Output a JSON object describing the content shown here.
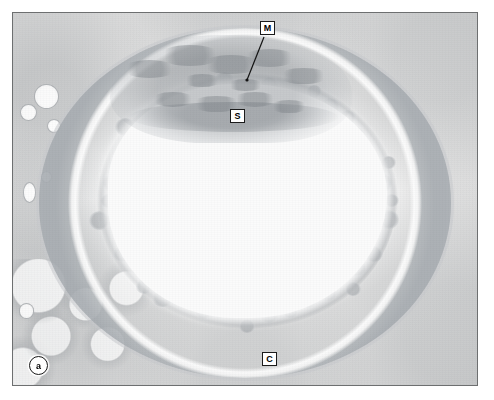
{
  "figure": {
    "kind": "light-micrograph",
    "panel_label": "a",
    "border_color": "#6d6f70",
    "background_color": "#ffffff"
  },
  "plate": {
    "x": 12,
    "y": 12,
    "width": 466,
    "height": 374,
    "stain_tone": "pale grey monochrome (H&E, desaturated)",
    "lumen_color": "#fbfbfb",
    "tissue_color": "#d5d5d5",
    "dark_detail_color": "#7a7f84"
  },
  "annotations": [
    {
      "id": "mucosa",
      "label": "M",
      "box_x": 259,
      "box_y": 20,
      "leader": {
        "from_x": 263,
        "from_y": 36,
        "to_x": 246,
        "to_y": 79
      },
      "has_leader": true
    },
    {
      "id": "submucosa",
      "label": "S",
      "box_x": 229,
      "box_y": 108,
      "has_leader": false
    },
    {
      "id": "circular-muscle",
      "label": "C",
      "box_x": 261,
      "box_y": 351,
      "has_leader": false
    }
  ],
  "panel": {
    "badge_label": "a"
  },
  "structures": {
    "lumen": "central irregular empty lumen, near-white",
    "mucosa_mass": "folded mucosal tissue occupying the upper part of the lumen",
    "submucosa": "loose band beneath the mucosal folds",
    "circular_muscle": "thick ring of radially segmented smooth-muscle bundles, approximately 34 bundles visible",
    "adventitia": "pale connective tissue with small vessels at the left margin and adipose lobules at the lower left"
  },
  "ring": {
    "bundle_count": 34,
    "septum_color": "#767b80"
  },
  "vessels": [
    {
      "left": "4.5%",
      "top": "19%",
      "w": "5.0%",
      "h": "6.2%"
    },
    {
      "left": "1.6%",
      "top": "24.5%",
      "w": "3.2%",
      "h": "4.0%"
    },
    {
      "left": "7.4%",
      "top": "28.5%",
      "w": "2.6%",
      "h": "3.2%"
    },
    {
      "left": "2.2%",
      "top": "45.5%",
      "w": "2.4%",
      "h": "5.0%"
    },
    {
      "left": "6.0%",
      "top": "42.5%",
      "w": "2.0%",
      "h": "2.6%"
    },
    {
      "left": "1.2%",
      "top": "78.0%",
      "w": "3.0%",
      "h": "3.6%"
    }
  ]
}
